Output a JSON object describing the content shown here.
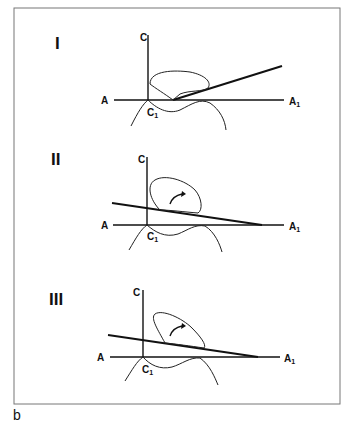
{
  "figure": {
    "caption": "b",
    "panels": [
      {
        "numeral": "I",
        "labels": {
          "top": "C",
          "left": "A",
          "right": "A",
          "right_sub": "1",
          "bottom": "C",
          "bottom_sub": "1"
        }
      },
      {
        "numeral": "II",
        "labels": {
          "top": "C",
          "left": "A",
          "right": "A",
          "right_sub": "1",
          "bottom": "C",
          "bottom_sub": "1"
        }
      },
      {
        "numeral": "III",
        "labels": {
          "top": "C",
          "left": "A",
          "right": "A",
          "right_sub": "1",
          "bottom": "C",
          "bottom_sub": "1"
        }
      }
    ]
  }
}
